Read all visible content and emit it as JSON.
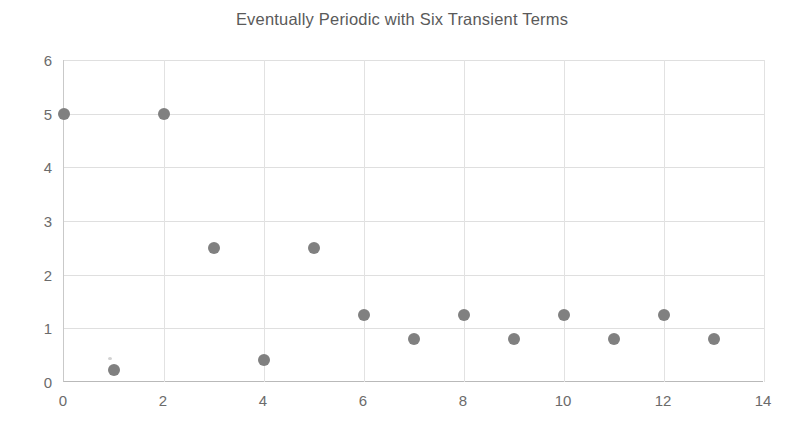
{
  "chart_data": {
    "type": "scatter",
    "title": "Eventually Periodic with Six Transient Terms",
    "xlabel": "",
    "ylabel": "",
    "xlim": [
      0,
      14
    ],
    "ylim": [
      0,
      6
    ],
    "xticks": [
      0,
      2,
      4,
      6,
      8,
      10,
      12,
      14
    ],
    "yticks": [
      0,
      1,
      2,
      3,
      4,
      5,
      6
    ],
    "grid": true,
    "legend": false,
    "marker_color": "#808080",
    "title_color": "#5a5a5a",
    "tick_color": "#6b6b6b",
    "gridline_color": "#dfdfdf",
    "x": [
      0,
      1,
      2,
      3,
      4,
      5,
      6,
      7,
      8,
      9,
      10,
      11,
      12,
      13
    ],
    "y": [
      5,
      0.22,
      5,
      2.5,
      0.41,
      2.5,
      1.25,
      0.8,
      1.25,
      0.8,
      1.25,
      0.8,
      1.25,
      0.8
    ],
    "points": [
      {
        "x": 0,
        "y": 5
      },
      {
        "x": 1,
        "y": 0.22
      },
      {
        "x": 2,
        "y": 5
      },
      {
        "x": 3,
        "y": 2.5
      },
      {
        "x": 4,
        "y": 0.41
      },
      {
        "x": 5,
        "y": 2.5
      },
      {
        "x": 6,
        "y": 1.25
      },
      {
        "x": 7,
        "y": 0.8
      },
      {
        "x": 8,
        "y": 1.25
      },
      {
        "x": 9,
        "y": 0.8
      },
      {
        "x": 10,
        "y": 1.25
      },
      {
        "x": 11,
        "y": 0.8
      },
      {
        "x": 12,
        "y": 1.25
      },
      {
        "x": 13,
        "y": 0.8
      }
    ]
  }
}
